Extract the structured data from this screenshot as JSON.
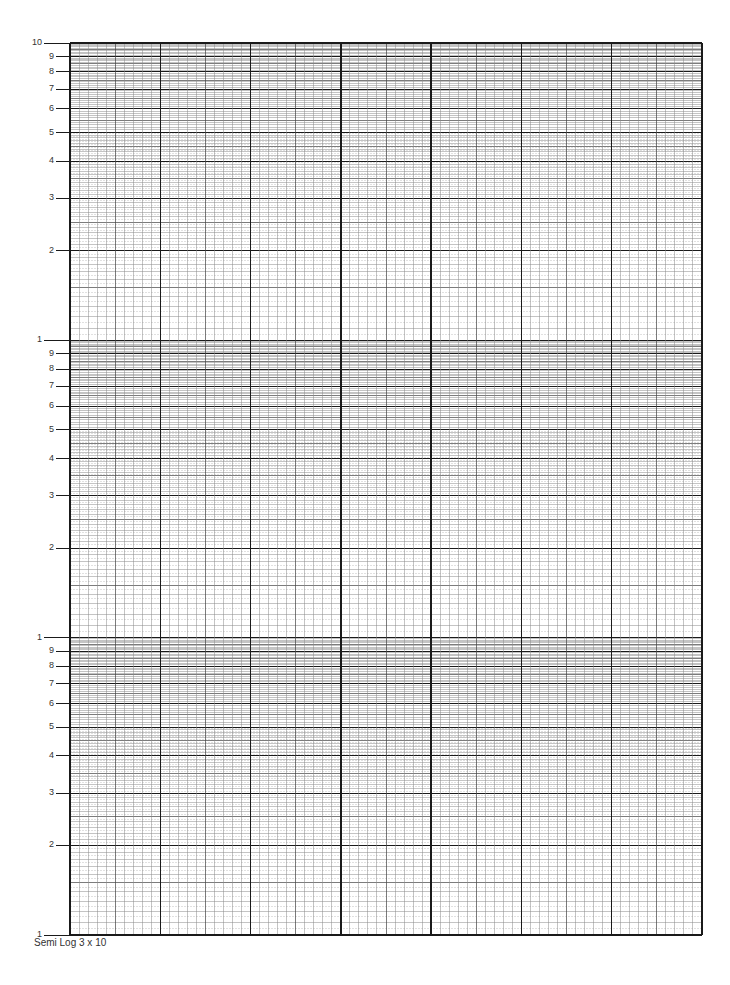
{
  "paper": {
    "title": "Semi Log 3 x 10",
    "type": "semi-log graph paper",
    "cycles": 3,
    "x_divisions": 10,
    "colors": {
      "major_line": "#1a1a1a",
      "mid_line": "#444444",
      "minor_line": "#8a8a8a",
      "label": "#333333"
    }
  },
  "grid": {
    "left": 70,
    "right": 702,
    "top": 43,
    "bottom": 935,
    "x_major_count": 7,
    "x_minor_per_major": 10
  },
  "y_axis": {
    "decades": [
      {
        "labels": [
          "10",
          "9",
          "8",
          "7",
          "6",
          "5",
          "4",
          "3",
          "2"
        ]
      },
      {
        "labels": [
          "1",
          "9",
          "8",
          "7",
          "6",
          "5",
          "4",
          "3",
          "2"
        ]
      },
      {
        "labels": [
          "1",
          "9",
          "8",
          "7",
          "6",
          "5",
          "4",
          "3",
          "2",
          "1"
        ]
      }
    ],
    "tick_values": [
      1,
      2,
      3,
      4,
      5,
      6,
      7,
      8,
      9,
      10
    ]
  },
  "chart_data": {
    "type": "table",
    "title": "Semi Log 3 x 10",
    "xlabel": "",
    "ylabel": "",
    "x_scale": "linear",
    "y_scale": "log",
    "y_cycles": 3,
    "y_cycle_labels": [
      "1",
      "2",
      "3",
      "4",
      "5",
      "6",
      "7",
      "8",
      "9",
      "10"
    ],
    "x_major_divisions": 7,
    "x_minor_per_major": 10,
    "grid": true,
    "series": []
  }
}
